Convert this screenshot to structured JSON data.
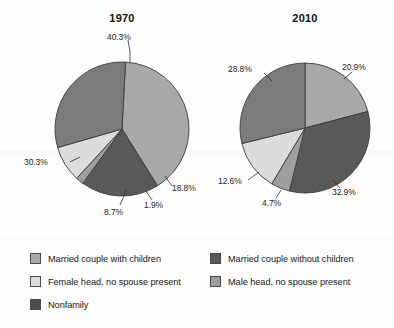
{
  "chart_data": [
    {
      "type": "pie",
      "title": "1970",
      "categories": [
        "Married couple with children",
        "Married couple without children",
        "Male head, no spouse present",
        "Female head, no spouse present",
        "Nonfamily"
      ],
      "values": [
        40.3,
        18.8,
        1.9,
        8.7,
        30.3
      ],
      "labels": [
        "40.3%",
        "18.8%",
        "1.9%",
        "8.7%",
        "30.3%"
      ],
      "colors": [
        "#a9a9a9",
        "#595959",
        "#9e9e9e",
        "#dcdcdc",
        "#7b7b7b"
      ],
      "xlabel": "",
      "ylabel": "",
      "legend_position": "bottom",
      "grid": false
    },
    {
      "type": "pie",
      "title": "2010",
      "categories": [
        "Married couple with children",
        "Married couple without children",
        "Male head, no spouse present",
        "Female head, no spouse present",
        "Nonfamily"
      ],
      "values": [
        20.9,
        32.9,
        4.7,
        12.6,
        28.8
      ],
      "labels": [
        "20.9%",
        "32.9%",
        "4.7%",
        "12.6%",
        "28.8%"
      ],
      "colors": [
        "#a9a9a9",
        "#595959",
        "#9e9e9e",
        "#dcdcdc",
        "#7b7b7b"
      ],
      "xlabel": "",
      "ylabel": "",
      "legend_position": "bottom",
      "grid": false
    }
  ],
  "charts": {
    "left": {
      "title": "1970",
      "slices": [
        {
          "label": "40.3%",
          "value": 40.3,
          "color": "#a9a9a9",
          "name": "married-with-children"
        },
        {
          "label": "18.8%",
          "value": 18.8,
          "color": "#595959",
          "name": "married-without-children"
        },
        {
          "label": "1.9%",
          "value": 1.9,
          "color": "#9e9e9e",
          "name": "male-head"
        },
        {
          "label": "8.7%",
          "value": 8.7,
          "color": "#dcdcdc",
          "name": "female-head"
        },
        {
          "label": "30.3%",
          "value": 30.3,
          "color": "#7b7b7b",
          "name": "nonfamily"
        }
      ]
    },
    "right": {
      "title": "2010",
      "slices": [
        {
          "label": "20.9%",
          "value": 20.9,
          "color": "#a9a9a9",
          "name": "married-with-children"
        },
        {
          "label": "32.9%",
          "value": 32.9,
          "color": "#595959",
          "name": "married-without-children"
        },
        {
          "label": "4.7%",
          "value": 4.7,
          "color": "#9e9e9e",
          "name": "male-head"
        },
        {
          "label": "12.6%",
          "value": 12.6,
          "color": "#dcdcdc",
          "name": "female-head"
        },
        {
          "label": "28.8%",
          "value": 28.8,
          "color": "#7b7b7b",
          "name": "nonfamily"
        }
      ]
    }
  },
  "legend": {
    "left_column": [
      {
        "label": "Married couple with children",
        "color": "#a9a9a9"
      },
      {
        "label": "Female head, no spouse present",
        "color": "#dcdcdc"
      },
      {
        "label": "Nonfamily",
        "color": "#4d4d4d"
      }
    ],
    "right_column": [
      {
        "label": "Married couple without children",
        "color": "#595959"
      },
      {
        "label": "Male head, no spouse present",
        "color": "#9e9e9e"
      }
    ]
  }
}
